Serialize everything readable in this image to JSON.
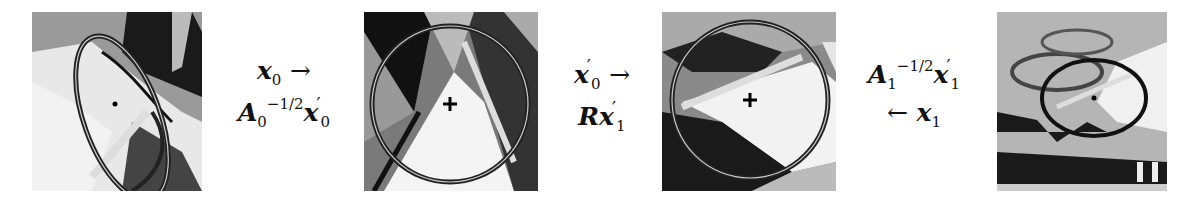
{
  "figure": {
    "panels": [
      {
        "id": "patch-0",
        "description": "original image patch with affine ellipse region",
        "region_shape": "ellipse",
        "center_marker": "dot"
      },
      {
        "id": "patch-0-normalized",
        "description": "affine-normalized patch with circular region",
        "region_shape": "circle",
        "center_marker": "plus"
      },
      {
        "id": "patch-1-normalized",
        "description": "affine-normalized patch with circular region",
        "region_shape": "circle",
        "center_marker": "plus"
      },
      {
        "id": "patch-1",
        "description": "original image patch with affine ellipse region",
        "region_shape": "ellipse",
        "center_marker": "dot"
      }
    ],
    "transforms": [
      {
        "line1_var": "x",
        "line1_sub": "0",
        "line1_op": "→",
        "line2_mat": "A",
        "line2_mat_sub": "0",
        "line2_mat_sup": "−1/2",
        "line2_var": "x",
        "line2_var_sub": "0",
        "prime": "′"
      },
      {
        "line1_var": "x",
        "line1_sub": "0",
        "line1_op": "→",
        "line2_mat": "R",
        "line2_var": "x",
        "line2_var_sub": "1",
        "prime": "′"
      },
      {
        "line1_mat": "A",
        "line1_mat_sub": "1",
        "line1_mat_sup": "−1/2",
        "line1_var": "x",
        "line1_var_sub": "1",
        "line2_op": "←",
        "line2_var": "x",
        "line2_sub": "1",
        "prime": "′"
      }
    ]
  }
}
